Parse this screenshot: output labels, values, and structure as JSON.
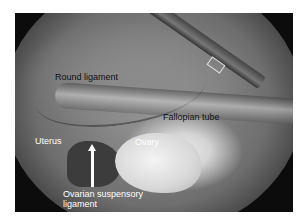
{
  "figure": {
    "labels": {
      "round_ligament": "Round ligament",
      "fallopian_tube": "Fallopian tube",
      "uterus": "Uterus",
      "ovary": "Ovary",
      "ovarian_suspensory_ligament_line1": "Ovarian suspensory",
      "ovarian_suspensory_ligament_line2": "ligament"
    },
    "colors": {
      "background": "#ffffff",
      "dark_label": "#111111",
      "light_label": "#ffffff",
      "arrow": "#ffffff"
    }
  }
}
